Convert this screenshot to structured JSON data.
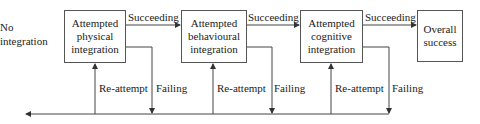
{
  "diagram": {
    "start_label": [
      "No",
      "integration"
    ],
    "stages": [
      {
        "id": "physical",
        "lines": [
          "Attempted",
          "physical",
          "integration"
        ]
      },
      {
        "id": "behavioural",
        "lines": [
          "Attempted",
          "behavioural",
          "integration"
        ]
      },
      {
        "id": "cognitive",
        "lines": [
          "Attempted",
          "cognitive",
          "integration"
        ]
      }
    ],
    "end_stage": {
      "lines": [
        "Overall",
        "success"
      ]
    },
    "edge_labels": {
      "success": "Succeeding",
      "retry": "Re-attempt",
      "fail": "Failing"
    },
    "colors": {
      "line": "#444444",
      "text": "#222222",
      "background": "#ffffff"
    }
  }
}
